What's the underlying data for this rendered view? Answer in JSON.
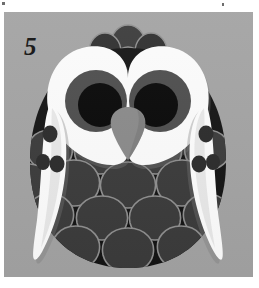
{
  "page": {
    "background_color": "#ffffff",
    "width": 259,
    "height": 288
  },
  "panel": {
    "background_color": "#a3a3a3",
    "x": 4,
    "y": 12,
    "width": 249,
    "height": 265
  },
  "marks": {
    "top_left_tick": "registration-tick",
    "top_right_tick": "registration-tick"
  },
  "plate": {
    "number": "5"
  },
  "illustration": {
    "subject": "owl",
    "style": "flat-graphic-cut-paper",
    "colors": {
      "background": "#a3a3a3",
      "body_dark": "#141414",
      "feather_fill": "#3b3b3b",
      "feather_outline": "#8f8f8f",
      "face_white": "#fbfbfb",
      "face_shadow": "#d8d8d8",
      "iris": "#4d4d4d",
      "pupil": "#080808",
      "beak": "#8a8a8a",
      "beak_shadow": "#6f6f6f",
      "wing_white": "#fcfcfc",
      "wing_shadow": "#dcdcdc",
      "wing_spot": "#2b2b2b"
    },
    "parts": [
      {
        "name": "head-crest-feathers",
        "count": 6
      },
      {
        "name": "facial-disc",
        "shape": "heart-mask",
        "lobes": 2
      },
      {
        "name": "eye-left",
        "iris": "#4d4d4d",
        "pupil": "#080808"
      },
      {
        "name": "eye-right",
        "iris": "#4d4d4d",
        "pupil": "#080808"
      },
      {
        "name": "beak",
        "shape": "rounded-triangle",
        "color": "#8a8a8a"
      },
      {
        "name": "breast-feathers",
        "rows": 5,
        "shape": "teardrop-scale"
      },
      {
        "name": "wing-left",
        "shape": "blade",
        "spots": 3
      },
      {
        "name": "wing-right",
        "shape": "blade",
        "spots": 3
      }
    ]
  }
}
